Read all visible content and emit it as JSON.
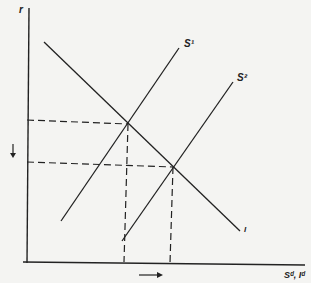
{
  "diagram": {
    "type": "supply-demand shift",
    "y_axis_label": "r",
    "x_axis_label": "Sᵈ, Iᵈ",
    "curves": [
      {
        "name": "S1",
        "label": "S¹"
      },
      {
        "name": "S2",
        "label": "S²"
      },
      {
        "name": "I",
        "label": "I"
      }
    ],
    "annotations": {
      "y_arrow": "down",
      "x_arrow": "right"
    },
    "colors": {
      "line": "#222222",
      "background": "#f4f4f2"
    }
  }
}
